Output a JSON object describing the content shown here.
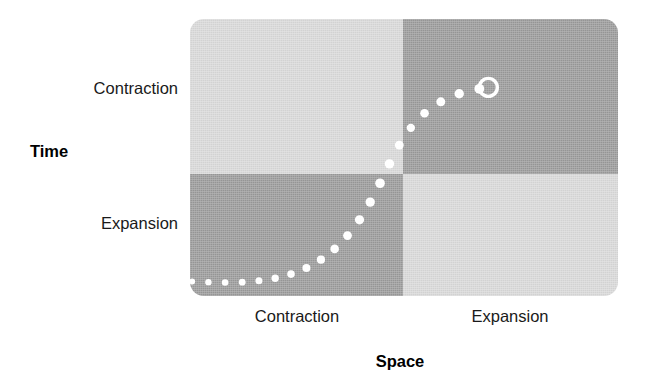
{
  "figure": {
    "annotation": "You are here"
  },
  "axes": {
    "x": {
      "title": "Space",
      "ticks": [
        "Contraction",
        "Expansion"
      ]
    },
    "y": {
      "title": "Time",
      "ticks": [
        "Contraction",
        "Expansion"
      ]
    }
  },
  "colors": {
    "light_quadrant": "#d9d9d9",
    "dark_quadrant": "#9a9a9a",
    "dot": "#ffffff",
    "text": "#111111",
    "background": "#ffffff"
  },
  "chart_data": {
    "type": "scatter",
    "title": "",
    "subtitle": "",
    "xlabel": "Space",
    "ylabel": "Time",
    "xlim": [
      0,
      1
    ],
    "ylim": [
      0,
      1
    ],
    "grid": false,
    "legend": null,
    "xtick_labels": [
      "Contraction",
      "Expansion"
    ],
    "xtick_positions": [
      0.25,
      0.75
    ],
    "ytick_labels": [
      "Expansion",
      "Contraction"
    ],
    "ytick_positions": [
      0.22,
      0.78
    ],
    "quadrants": [
      {
        "name": "space-contraction-time-contraction",
        "x": [
          0,
          0.5
        ],
        "y": [
          0.5,
          1
        ],
        "shade": "light"
      },
      {
        "name": "space-expansion-time-contraction",
        "x": [
          0.5,
          1
        ],
        "y": [
          0.5,
          1
        ],
        "shade": "dark"
      },
      {
        "name": "space-contraction-time-expansion",
        "x": [
          0,
          0.5
        ],
        "y": [
          0,
          0.5
        ],
        "shade": "dark"
      },
      {
        "name": "space-expansion-time-expansion",
        "x": [
          0.5,
          1
        ],
        "y": [
          0,
          0.5
        ],
        "shade": "light"
      }
    ],
    "series": [
      {
        "name": "trajectory",
        "style": "dotted",
        "marker": "circle",
        "color": "#ffffff",
        "points": [
          {
            "x": 0.005,
            "y": 0.052,
            "r": 3.0
          },
          {
            "x": 0.043,
            "y": 0.05,
            "r": 3.2
          },
          {
            "x": 0.082,
            "y": 0.049,
            "r": 3.3
          },
          {
            "x": 0.122,
            "y": 0.05,
            "r": 3.4
          },
          {
            "x": 0.161,
            "y": 0.055,
            "r": 3.5
          },
          {
            "x": 0.199,
            "y": 0.064,
            "r": 3.7
          },
          {
            "x": 0.236,
            "y": 0.079,
            "r": 3.8
          },
          {
            "x": 0.272,
            "y": 0.101,
            "r": 4.0
          },
          {
            "x": 0.306,
            "y": 0.131,
            "r": 4.1
          },
          {
            "x": 0.338,
            "y": 0.17,
            "r": 4.3
          },
          {
            "x": 0.368,
            "y": 0.218,
            "r": 4.4
          },
          {
            "x": 0.396,
            "y": 0.275,
            "r": 4.6
          },
          {
            "x": 0.421,
            "y": 0.339,
            "r": 4.7
          },
          {
            "x": 0.444,
            "y": 0.407,
            "r": 4.8
          },
          {
            "x": 0.466,
            "y": 0.477,
            "r": 4.7
          },
          {
            "x": 0.489,
            "y": 0.545,
            "r": 4.4
          },
          {
            "x": 0.516,
            "y": 0.607,
            "r": 4.2
          },
          {
            "x": 0.548,
            "y": 0.66,
            "r": 4.3
          },
          {
            "x": 0.586,
            "y": 0.701,
            "r": 4.5
          },
          {
            "x": 0.629,
            "y": 0.73,
            "r": 4.7
          },
          {
            "x": 0.676,
            "y": 0.748,
            "r": 4.9
          }
        ]
      },
      {
        "name": "current-position",
        "style": "ring",
        "marker": "open-circle",
        "color": "#ffffff",
        "points": [
          {
            "x": 0.697,
            "y": 0.753,
            "r": 9.0,
            "stroke": 3.4
          }
        ]
      }
    ],
    "annotations": [
      {
        "text": "You are here",
        "x": 0.62,
        "y": 0.8,
        "bold": true,
        "color": "#111111"
      }
    ]
  }
}
